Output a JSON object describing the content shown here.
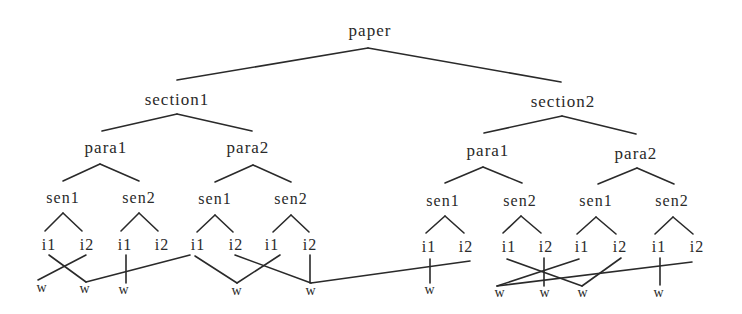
{
  "diagram": {
    "type": "tree",
    "colors": {
      "line": "#2a2a2a",
      "text": "#2a2a2a",
      "background": "#ffffff"
    },
    "nodes": [
      {
        "id": "paper",
        "label": "paper",
        "x": 370,
        "y": 30,
        "level": 0
      },
      {
        "id": "s1",
        "label": "section1",
        "x": 177,
        "y": 99,
        "level": 1
      },
      {
        "id": "s2",
        "label": "section2",
        "x": 563,
        "y": 101,
        "level": 1
      },
      {
        "id": "s1p1",
        "label": "para1",
        "x": 106,
        "y": 147,
        "level": 2
      },
      {
        "id": "s1p2",
        "label": "para2",
        "x": 248,
        "y": 147,
        "level": 2
      },
      {
        "id": "s2p1",
        "label": "para1",
        "x": 488,
        "y": 150,
        "level": 2
      },
      {
        "id": "s2p2",
        "label": "para2",
        "x": 636,
        "y": 153,
        "level": 2
      },
      {
        "id": "a1",
        "label": "sen1",
        "x": 63,
        "y": 198,
        "level": 3
      },
      {
        "id": "a2",
        "label": "sen2",
        "x": 139,
        "y": 198,
        "level": 3
      },
      {
        "id": "b1",
        "label": "sen1",
        "x": 215,
        "y": 199,
        "level": 3
      },
      {
        "id": "b2",
        "label": "sen2",
        "x": 291,
        "y": 199,
        "level": 3
      },
      {
        "id": "c1",
        "label": "sen1",
        "x": 443,
        "y": 201,
        "level": 3
      },
      {
        "id": "c2",
        "label": "sen2",
        "x": 520,
        "y": 201,
        "level": 3
      },
      {
        "id": "d1",
        "label": "sen1",
        "x": 596,
        "y": 201,
        "level": 3
      },
      {
        "id": "d2",
        "label": "sen2",
        "x": 672,
        "y": 201,
        "level": 3
      },
      {
        "id": "a1i1",
        "label": "i1",
        "x": 49,
        "y": 245,
        "level": 4
      },
      {
        "id": "a1i2",
        "label": "i2",
        "x": 87,
        "y": 245,
        "level": 4
      },
      {
        "id": "a2i1",
        "label": "i1",
        "x": 125,
        "y": 245,
        "level": 4
      },
      {
        "id": "a2i2",
        "label": "i2",
        "x": 162,
        "y": 245,
        "level": 4
      },
      {
        "id": "b1i1",
        "label": "i1",
        "x": 198,
        "y": 245,
        "level": 4
      },
      {
        "id": "b1i2",
        "label": "i2",
        "x": 236,
        "y": 245,
        "level": 4
      },
      {
        "id": "b2i1",
        "label": "i1",
        "x": 272,
        "y": 245,
        "level": 4
      },
      {
        "id": "b2i2",
        "label": "i2",
        "x": 310,
        "y": 245,
        "level": 4
      },
      {
        "id": "c1i1",
        "label": "i1",
        "x": 429,
        "y": 247,
        "level": 4
      },
      {
        "id": "c1i2",
        "label": "i2",
        "x": 466,
        "y": 247,
        "level": 4
      },
      {
        "id": "c2i1",
        "label": "i1",
        "x": 509,
        "y": 247,
        "level": 4
      },
      {
        "id": "c2i2",
        "label": "i2",
        "x": 546,
        "y": 247,
        "level": 4
      },
      {
        "id": "d1i1",
        "label": "i1",
        "x": 582,
        "y": 247,
        "level": 4
      },
      {
        "id": "d1i2",
        "label": "i2",
        "x": 620,
        "y": 247,
        "level": 4
      },
      {
        "id": "d2i1",
        "label": "i1",
        "x": 659,
        "y": 247,
        "level": 4
      },
      {
        "id": "d2i2",
        "label": "i2",
        "x": 697,
        "y": 247,
        "level": 4
      },
      {
        "id": "w1",
        "label": "w",
        "x": 42,
        "y": 288,
        "level": 5
      },
      {
        "id": "w2",
        "label": "w",
        "x": 85,
        "y": 289,
        "level": 5
      },
      {
        "id": "w3",
        "label": "w",
        "x": 124,
        "y": 290,
        "level": 5
      },
      {
        "id": "w4",
        "label": "w",
        "x": 237,
        "y": 291,
        "level": 5
      },
      {
        "id": "w5",
        "label": "w",
        "x": 311,
        "y": 291,
        "level": 5
      },
      {
        "id": "w6",
        "label": "w",
        "x": 430,
        "y": 290,
        "level": 5
      },
      {
        "id": "w7",
        "label": "w",
        "x": 500,
        "y": 293,
        "level": 5
      },
      {
        "id": "w8",
        "label": "w",
        "x": 545,
        "y": 293,
        "level": 5
      },
      {
        "id": "w9",
        "label": "w",
        "x": 583,
        "y": 293,
        "level": 5
      },
      {
        "id": "w10",
        "label": "w",
        "x": 659,
        "y": 293,
        "level": 5
      }
    ],
    "edges": [
      [
        368,
        48,
        177,
        80
      ],
      [
        368,
        48,
        561,
        82
      ],
      [
        177,
        114,
        102,
        131
      ],
      [
        177,
        114,
        252,
        131
      ],
      [
        562,
        116,
        484,
        133
      ],
      [
        562,
        116,
        636,
        134
      ],
      [
        100,
        164,
        63,
        181
      ],
      [
        100,
        164,
        139,
        181
      ],
      [
        253,
        165,
        215,
        182
      ],
      [
        253,
        165,
        291,
        182
      ],
      [
        483,
        167,
        445,
        183
      ],
      [
        483,
        167,
        522,
        183
      ],
      [
        637,
        168,
        598,
        184
      ],
      [
        637,
        168,
        674,
        184
      ],
      [
        63,
        213,
        45,
        231
      ],
      [
        63,
        213,
        82,
        231
      ],
      [
        139,
        213,
        121,
        231
      ],
      [
        139,
        213,
        158,
        231
      ],
      [
        215,
        215,
        197,
        232
      ],
      [
        215,
        215,
        233,
        232
      ],
      [
        291,
        215,
        273,
        232
      ],
      [
        291,
        215,
        309,
        232
      ],
      [
        445,
        216,
        426,
        233
      ],
      [
        445,
        216,
        464,
        233
      ],
      [
        521,
        216,
        503,
        233
      ],
      [
        521,
        216,
        541,
        233
      ],
      [
        596,
        217,
        577,
        234
      ],
      [
        596,
        217,
        616,
        234
      ],
      [
        673,
        217,
        655,
        234
      ],
      [
        673,
        217,
        693,
        234
      ],
      [
        49,
        255,
        86,
        282
      ],
      [
        86,
        255,
        38,
        280
      ],
      [
        86,
        282,
        190,
        255
      ],
      [
        126,
        255,
        126,
        283
      ],
      [
        195,
        256,
        237,
        283
      ],
      [
        237,
        283,
        280,
        255
      ],
      [
        235,
        255,
        311,
        283
      ],
      [
        310,
        255,
        310,
        283
      ],
      [
        311,
        283,
        470,
        261
      ],
      [
        430,
        259,
        430,
        283
      ],
      [
        507,
        259,
        582,
        286
      ],
      [
        544,
        258,
        544,
        286
      ],
      [
        497,
        286,
        579,
        259
      ],
      [
        582,
        286,
        621,
        258
      ],
      [
        497,
        286,
        692,
        262
      ],
      [
        660,
        258,
        660,
        285
      ]
    ]
  }
}
